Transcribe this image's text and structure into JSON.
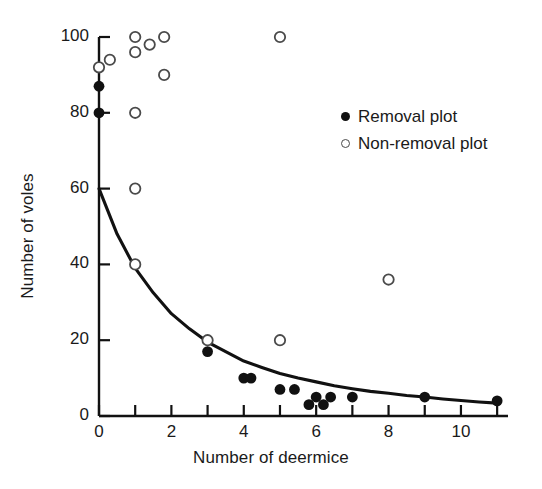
{
  "chart_data": {
    "type": "scatter",
    "title": "",
    "xlabel": "Number of deermice",
    "ylabel": "Number of voles",
    "xlim": [
      0,
      11.3
    ],
    "ylim": [
      0,
      103
    ],
    "grid": false,
    "xticks": [
      0,
      1,
      2,
      3,
      4,
      5,
      6,
      7,
      8,
      9,
      10,
      11
    ],
    "xtick_labels": [
      "0",
      "",
      "2",
      "",
      "4",
      "",
      "6",
      "",
      "8",
      "",
      "10",
      ""
    ],
    "yticks": [
      0,
      20,
      40,
      60,
      80,
      100
    ],
    "ytick_labels": [
      "0",
      "20",
      "40",
      "60",
      "80",
      "100"
    ],
    "legend_position": "upper right",
    "series": [
      {
        "name": "Removal plot",
        "marker": "filled-circle",
        "color": "#111111",
        "points": [
          [
            0,
            87
          ],
          [
            0,
            80
          ],
          [
            3,
            17
          ],
          [
            4,
            10
          ],
          [
            4.2,
            10
          ],
          [
            5,
            7
          ],
          [
            5.4,
            7
          ],
          [
            5.8,
            3
          ],
          [
            6,
            5
          ],
          [
            6.2,
            3
          ],
          [
            6.4,
            5
          ],
          [
            7,
            5
          ],
          [
            9,
            5
          ],
          [
            11,
            4
          ]
        ]
      },
      {
        "name": "Non-removal plot",
        "marker": "open-circle",
        "color": "#4a4a4a",
        "points": [
          [
            0,
            92
          ],
          [
            0.3,
            94
          ],
          [
            1,
            100
          ],
          [
            1,
            96
          ],
          [
            1.4,
            98
          ],
          [
            1.8,
            100
          ],
          [
            1.8,
            90
          ],
          [
            1,
            80
          ],
          [
            1,
            60
          ],
          [
            1,
            40
          ],
          [
            3,
            20
          ],
          [
            5,
            100
          ],
          [
            5,
            20
          ],
          [
            8,
            36
          ]
        ]
      }
    ],
    "fit_curve": {
      "name": "exponential-decay-fit",
      "color": "#111111",
      "description": "Fitted decay curve from 60 voles at 0 deermice to ~3 voles at 11 deermice",
      "points": [
        [
          0,
          60
        ],
        [
          0.5,
          48
        ],
        [
          1,
          39
        ],
        [
          1.5,
          32.5
        ],
        [
          2,
          27
        ],
        [
          2.5,
          23
        ],
        [
          3,
          19.5
        ],
        [
          3.5,
          17
        ],
        [
          4,
          14.5
        ],
        [
          4.5,
          12.8
        ],
        [
          5,
          11.2
        ],
        [
          5.5,
          10
        ],
        [
          6,
          9
        ],
        [
          6.5,
          8
        ],
        [
          7,
          7.2
        ],
        [
          7.5,
          6.5
        ],
        [
          8,
          6
        ],
        [
          8.5,
          5.4
        ],
        [
          9,
          5
        ],
        [
          9.5,
          4.5
        ],
        [
          10,
          4.1
        ],
        [
          10.5,
          3.7
        ],
        [
          11,
          3.4
        ]
      ]
    }
  },
  "legend": {
    "entries": [
      {
        "label": "Removal plot",
        "marker": "filled-circle"
      },
      {
        "label": "Non-removal plot",
        "marker": "open-circle"
      }
    ]
  }
}
